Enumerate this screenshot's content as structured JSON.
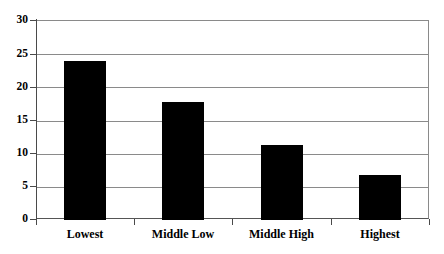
{
  "chart_data": {
    "type": "bar",
    "title": "",
    "xlabel": "",
    "ylabel": "",
    "categories": [
      "Lowest",
      "Middle Low",
      "Middle High",
      "Highest"
    ],
    "values": [
      24.0,
      17.8,
      11.3,
      6.8
    ],
    "ylim": [
      0,
      30
    ],
    "yticks": [
      0,
      5,
      10,
      15,
      20,
      25,
      30
    ],
    "ytick_labels": [
      "0",
      "5",
      "10",
      "15",
      "20",
      "25",
      "30"
    ],
    "grid": true,
    "legend": false,
    "legend_position": "none",
    "bar_color": "#000000",
    "grid_color": "#8a8a8a",
    "axis_color": "#4a4a4a",
    "background_color": "#ffffff"
  },
  "axes": {
    "y_tick_labels": [
      "30",
      "25",
      "20",
      "15",
      "10",
      "5",
      "0"
    ],
    "x_tick_labels": [
      "Lowest",
      "Middle Low",
      "Middle High",
      "Highest"
    ]
  }
}
